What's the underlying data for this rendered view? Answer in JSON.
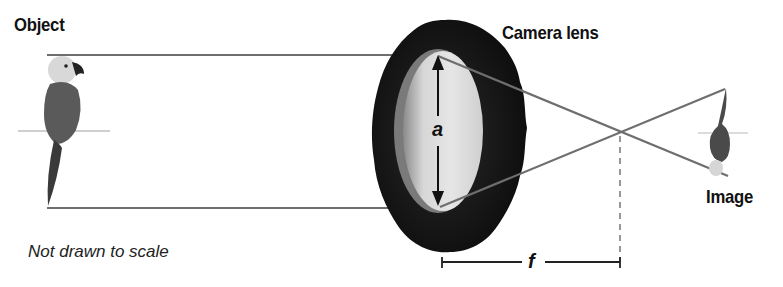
{
  "labels": {
    "object": "Object",
    "camera_lens": "Camera lens",
    "image": "Image",
    "note": "Not drawn to scale",
    "aperture_var": "a",
    "focal_var": "f"
  },
  "colors": {
    "ray": "#6e6e6e",
    "lens_body": "#151515",
    "lens_glass": "#e2e2e2",
    "text": "#111111"
  }
}
